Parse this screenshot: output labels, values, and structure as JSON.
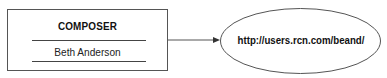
{
  "diagram": {
    "entity": {
      "title": "COMPOSER",
      "value": "Beth Anderson"
    },
    "connector": {
      "type": "arrow",
      "direction": "right"
    },
    "target": {
      "shape": "ellipse",
      "label": "http://users.rcn.com/beand/"
    }
  }
}
